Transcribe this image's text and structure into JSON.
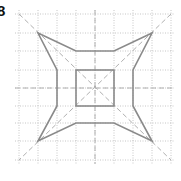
{
  "figure": {
    "label": "8",
    "colors": {
      "grid": "#b8b8b8",
      "guides": "#b0b0b0",
      "shape": "#8a8a8a",
      "background": "#ffffff"
    },
    "grid": {
      "x_lines": [
        19,
        38,
        57,
        76,
        95,
        114,
        133,
        152,
        171
      ],
      "y_lines": [
        14,
        33,
        51,
        70,
        88,
        106,
        123,
        141,
        160
      ]
    },
    "center": [
      95,
      88
    ],
    "outer_shape_points": [
      [
        38,
        33
      ],
      [
        76,
        51
      ],
      [
        114,
        51
      ],
      [
        152,
        33
      ],
      [
        133,
        70
      ],
      [
        133,
        106
      ],
      [
        152,
        141
      ],
      [
        114,
        123
      ],
      [
        76,
        123
      ],
      [
        38,
        141
      ],
      [
        57,
        106
      ],
      [
        57,
        70
      ]
    ],
    "inner_square": {
      "x": 76,
      "y": 70,
      "width": 38,
      "height": 36
    }
  }
}
